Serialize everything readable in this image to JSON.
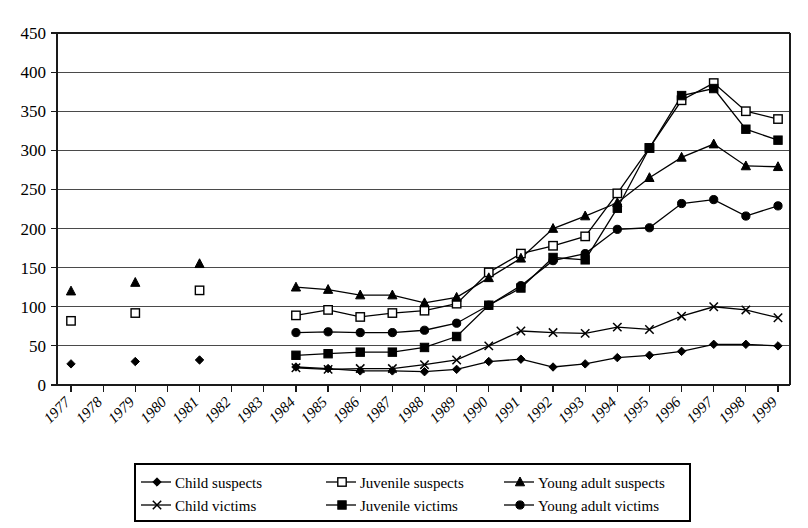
{
  "chart_data": {
    "type": "line",
    "title": "",
    "xlabel": "",
    "ylabel": "",
    "ylim": [
      0,
      450
    ],
    "ytick_step": 50,
    "grid": true,
    "legend_position": "bottom",
    "categories": [
      "1977",
      "1978",
      "1979",
      "1980",
      "1981",
      "1982",
      "1983",
      "1984",
      "1985",
      "1986",
      "1987",
      "1988",
      "1989",
      "1990",
      "1991",
      "1992",
      "1993",
      "1994",
      "1995",
      "1996",
      "1997",
      "1998",
      "1999"
    ],
    "ytick_labels": [
      "0",
      "50",
      "100",
      "150",
      "200",
      "250",
      "300",
      "350",
      "400",
      "450"
    ],
    "series": [
      {
        "name": "Child suspects",
        "marker": "diamond-filled",
        "values": [
          27,
          null,
          30,
          null,
          32,
          null,
          null,
          23,
          21,
          18,
          18,
          17,
          20,
          30,
          33,
          23,
          27,
          35,
          38,
          43,
          52,
          52,
          50
        ]
      },
      {
        "name": "Juvenile suspects",
        "marker": "square-open",
        "values": [
          82,
          null,
          92,
          null,
          121,
          null,
          null,
          89,
          96,
          87,
          92,
          95,
          104,
          144,
          168,
          178,
          190,
          245,
          303,
          364,
          386,
          350,
          340
        ]
      },
      {
        "name": "Young adult suspects",
        "marker": "triangle-filled",
        "values": [
          120,
          null,
          131,
          null,
          155,
          null,
          null,
          125,
          122,
          115,
          115,
          105,
          112,
          137,
          162,
          200,
          216,
          233,
          265,
          291,
          308,
          280,
          279
        ]
      },
      {
        "name": "Child victims",
        "marker": "x-cross",
        "values": [
          null,
          null,
          null,
          null,
          null,
          null,
          null,
          22,
          20,
          21,
          21,
          26,
          32,
          50,
          69,
          67,
          66,
          74,
          71,
          88,
          100,
          96,
          86
        ]
      },
      {
        "name": "Juvenile victims",
        "marker": "square-filled",
        "values": [
          null,
          null,
          null,
          null,
          null,
          null,
          null,
          38,
          40,
          42,
          42,
          48,
          62,
          102,
          124,
          163,
          160,
          226,
          303,
          370,
          379,
          327,
          313
        ]
      },
      {
        "name": "Young adult victims",
        "marker": "circle-filled",
        "values": [
          null,
          null,
          null,
          null,
          null,
          null,
          null,
          67,
          68,
          67,
          67,
          70,
          79,
          102,
          127,
          159,
          168,
          199,
          201,
          232,
          237,
          216,
          229
        ]
      }
    ]
  },
  "legend": {
    "entries": [
      {
        "label": "Child suspects",
        "marker": "diamond-filled"
      },
      {
        "label": "Juvenile suspects",
        "marker": "square-open"
      },
      {
        "label": "Young adult suspects",
        "marker": "triangle-filled"
      },
      {
        "label": "Child victims",
        "marker": "x-cross"
      },
      {
        "label": "Juvenile victims",
        "marker": "square-filled"
      },
      {
        "label": "Young adult victims",
        "marker": "circle-filled"
      }
    ]
  },
  "colors": {
    "ink": "#000000",
    "grid": "#4a4a4a",
    "background": "#ffffff"
  }
}
